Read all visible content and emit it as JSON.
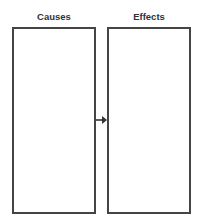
{
  "diagram": {
    "left_column": {
      "title": "Causes"
    },
    "right_column": {
      "title": "Effects"
    },
    "connector": {
      "icon": "arrow-right-icon",
      "color": "#333333"
    },
    "border_color": "#444444"
  }
}
